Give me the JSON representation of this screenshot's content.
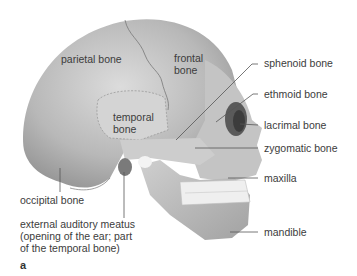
{
  "figure": {
    "panel_letter": "a",
    "labels": {
      "parietal": "parietal bone",
      "frontal_line1": "frontal",
      "frontal_line2": "bone",
      "temporal_line1": "temporal",
      "temporal_line2": "bone",
      "sphenoid": "sphenoid bone",
      "ethmoid": "ethmoid bone",
      "lacrimal": "lacrimal bone",
      "zygomatic": "zygomatic bone",
      "maxilla": "maxilla",
      "mandible": "mandible",
      "occipital": "occipital bone",
      "meatus_line1": "external auditory meatus",
      "meatus_line2": "(opening of the ear; part",
      "meatus_line3": "of the temporal bone)"
    },
    "colors": {
      "bone_light": "#d8d8d8",
      "bone_mid": "#b4b4b4",
      "bone_dark": "#8a8a8a",
      "teeth": "#f2f2f2",
      "leader_line": "#555555"
    }
  }
}
